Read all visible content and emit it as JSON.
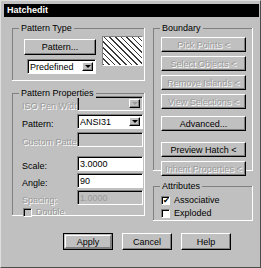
{
  "window": {
    "title": "Hatchedit"
  },
  "pattern_type": {
    "group_label": "Pattern Type",
    "pattern_button": "Pattern...",
    "type_combo_value": "Predefined",
    "swatch_name": "ANSI31 hatch preview"
  },
  "pattern_properties": {
    "group_label": "Pattern Properties",
    "iso_pen_width_label": "ISO Pen Width:",
    "iso_pen_width_value": "",
    "pattern_label": "Pattern:",
    "pattern_value": "ANSI31",
    "custom_pattern_label": "Custom Pattern:",
    "custom_pattern_value": "",
    "scale_label": "Scale:",
    "scale_value": "3.0000",
    "angle_label": "Angle:",
    "angle_value": "90",
    "spacing_label": "Spacing:",
    "spacing_value": "1.0000",
    "double_label": "Double",
    "double_checked": false
  },
  "boundary": {
    "group_label": "Boundary",
    "buttons": [
      {
        "label": "Pick Points <",
        "enabled": false
      },
      {
        "label": "Select Objects <",
        "enabled": false
      },
      {
        "label": "Remove Islands <",
        "enabled": false
      },
      {
        "label": "View Selections <",
        "enabled": false
      },
      {
        "label": "Advanced...",
        "enabled": true
      },
      {
        "label": "Preview Hatch <",
        "enabled": true
      },
      {
        "label": "Inherit Properties <",
        "enabled": false
      }
    ]
  },
  "attributes": {
    "group_label": "Attributes",
    "associative_label": "Associative",
    "associative_checked": true,
    "exploded_label": "Exploded",
    "exploded_checked": false,
    "check_glyph": "✔"
  },
  "footer": {
    "apply_label": "Apply",
    "cancel_label": "Cancel",
    "help_label": "Help"
  }
}
